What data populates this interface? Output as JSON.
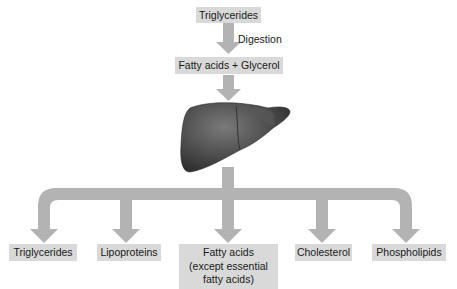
{
  "diagram": {
    "top_box": "Triglycerides",
    "step_label": "Digestion",
    "middle_box": "Fatty acids + Glycerol",
    "organ": "Liver",
    "outputs": [
      {
        "label": "Triglycerides"
      },
      {
        "label": "Lipoproteins"
      },
      {
        "lines": [
          "Fatty acids",
          "(except essential",
          "fatty acids)"
        ]
      },
      {
        "label": "Cholesterol"
      },
      {
        "label": "Phospholipids"
      }
    ],
    "colors": {
      "box_fill": "#d9d9d9",
      "arrow_fill": "#b3b3b3",
      "liver_fill": "#4a4a4a"
    }
  }
}
